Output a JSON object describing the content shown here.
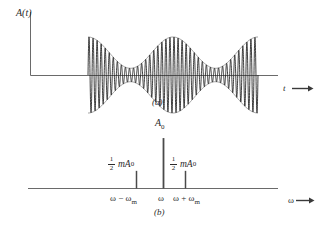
{
  "figure": {
    "background_color": "#ffffff",
    "line_color": "#555555",
    "text_color": "#2b2b2b"
  },
  "panel_a": {
    "caption": "(a)",
    "y_axis_label": "A(t)",
    "x_axis_label": "t",
    "description": "Amplitude modulated carrier waveform with sinusoidal envelope"
  },
  "panel_b": {
    "caption": "(b)",
    "y_axis_label": "A",
    "y_axis_label_sub": "0",
    "x_axis_label": "ω",
    "amplitude_label_lower": {
      "numerator": "1",
      "denominator": "2",
      "term": "mA",
      "term_sub": "0"
    },
    "amplitude_label_upper": {
      "numerator": "1",
      "denominator": "2",
      "term": "mA",
      "term_sub": "0"
    },
    "tick_lower": "ω − ω",
    "tick_lower_sub": "m",
    "tick_carrier": "ω",
    "tick_upper": "ω + ω",
    "tick_upper_sub": "m"
  },
  "chart_data": {
    "type": "line",
    "subcharts": [
      {
        "id": "panel_a",
        "type": "line",
        "title": "(a)",
        "xlabel": "t",
        "ylabel": "A(t)",
        "grid": false,
        "legend": false,
        "description": "Carrier sinusoid whose amplitude varies as a raised cosine envelope; three envelope maxima and two envelope minima are visible.",
        "carrier_cycles_visible": 42,
        "envelope_maxima_count": 3,
        "envelope_minima_count": 2,
        "modulation_index_m": 0.7,
        "carrier_amplitude_A0": 1.0,
        "envelope_max_amplitude": 1.7,
        "envelope_min_amplitude": 0.3,
        "x_range_pixels": [
          88,
          258
        ],
        "baseline_y_pixels": 75
      },
      {
        "id": "panel_b",
        "type": "bar",
        "title": "(b)",
        "xlabel": "ω",
        "ylabel": "A₀",
        "grid": false,
        "legend": false,
        "description": "Line spectrum of an AM signal: a tall carrier line at ω flanked by two equal sidebands of height ½ mA₀ at ω − ωm and ω + ωm.",
        "categories": [
          "ω − ωm",
          "ω",
          "ω + ωm"
        ],
        "values": [
          0.35,
          1.0,
          0.35
        ],
        "value_labels": [
          "½ mA₀",
          "A₀",
          "½ mA₀"
        ],
        "ylim": [
          0,
          1.15
        ],
        "baseline_y_pixels": 188,
        "line_x_pixels": [
          136,
          163,
          185
        ]
      }
    ]
  }
}
